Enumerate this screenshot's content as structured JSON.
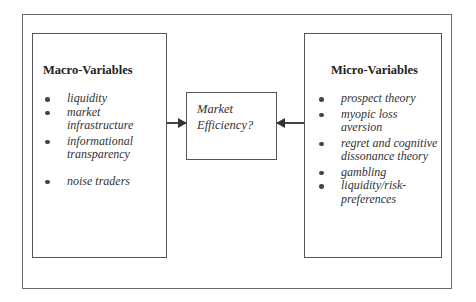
{
  "diagram": {
    "macro": {
      "title": "Macro-Variables",
      "items": [
        {
          "label": "liquidity"
        },
        {
          "label": "market infrastructure"
        },
        {
          "label": "informational transparency"
        },
        {
          "label": "noise traders"
        }
      ]
    },
    "center": {
      "line1": "Market",
      "line2": "Efficiency?"
    },
    "micro": {
      "title": "Micro-Variables",
      "items": [
        {
          "label": "prospect theory"
        },
        {
          "label": "myopic loss aversion"
        },
        {
          "label": "regret and cognitive dissonance theory"
        },
        {
          "label": "gambling"
        },
        {
          "label": "liquidity/risk-preferences"
        }
      ]
    },
    "arrows": [
      {
        "from": "Macro-Variables",
        "to": "Market Efficiency?"
      },
      {
        "from": "Micro-Variables",
        "to": "Market Efficiency?"
      }
    ]
  }
}
